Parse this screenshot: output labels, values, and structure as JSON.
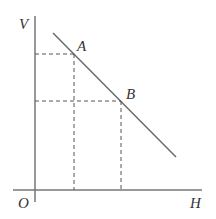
{
  "diagram": {
    "axes": {
      "y_label": "V",
      "x_label": "H",
      "origin_label": "O"
    },
    "points": [
      {
        "label": "A"
      },
      {
        "label": "B"
      }
    ],
    "colors": {
      "line": "#6b6b6b",
      "dash": "#555555",
      "axis": "#777777"
    }
  }
}
